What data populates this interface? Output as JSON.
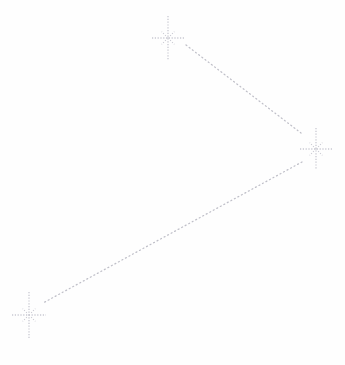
{
  "diagram": {
    "type": "star-constellation-path",
    "width": 345,
    "height": 365,
    "background_color": "#fefefe",
    "marker_color": "#c9c9d2",
    "line_color": "#bfbfc8",
    "nodes": [
      {
        "id": "star-top",
        "label": "top-star",
        "x": 168,
        "y": 38,
        "vertical_ray_length": 22,
        "horizontal_ray_length": 16,
        "diagonal_ray_length": 9
      },
      {
        "id": "star-right",
        "label": "right-star",
        "x": 316,
        "y": 149,
        "vertical_ray_length": 21,
        "horizontal_ray_length": 16,
        "diagonal_ray_length": 9
      },
      {
        "id": "star-bottom-left",
        "label": "bottom-left-star",
        "x": 29,
        "y": 315,
        "vertical_ray_length": 23,
        "horizontal_ray_length": 17,
        "diagonal_ray_length": 9
      }
    ],
    "edges": [
      {
        "id": "edge-top-to-right",
        "label": "top-star to right-star",
        "from": "star-top",
        "to": "star-right",
        "x1": 186,
        "y1": 45,
        "x2": 301,
        "y2": 133,
        "dash_pattern": "1 3",
        "stroke_width": 1.25
      },
      {
        "id": "edge-right-to-bottom-left",
        "label": "right-star to bottom-left-star",
        "from": "star-right",
        "to": "star-bottom-left",
        "x1": 302,
        "y1": 162,
        "x2": 43,
        "y2": 303,
        "dash_pattern": "1 3",
        "stroke_width": 1.25
      }
    ]
  }
}
